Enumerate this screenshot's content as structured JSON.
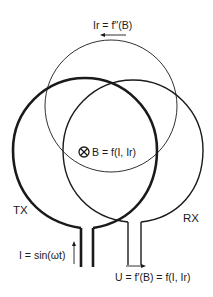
{
  "diagram": {
    "colors": {
      "background": "#ffffff",
      "ink": "#1a1a1a"
    },
    "coils": {
      "tx": {
        "label": "TX",
        "current_label": "I = sin(ωt)",
        "line": "thick"
      },
      "rx": {
        "label": "RX",
        "voltage_label": "U = f′(B) = f(I, Ir)",
        "line": "medium"
      },
      "eddy": {
        "current_label": "Ir = f′′(B)",
        "line": "thin"
      }
    },
    "field": {
      "symbol": "circled-x-into-page",
      "label": "B = f(I, Ir)"
    }
  }
}
